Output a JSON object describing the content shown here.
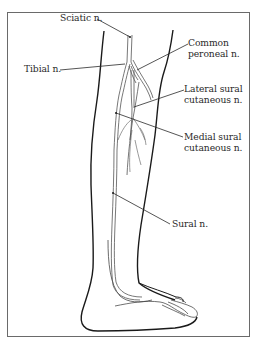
{
  "figure": {
    "labels": {
      "sciatic": "Sciatic n.",
      "tibial": "Tibial n.",
      "common_peroneal_1": "Common",
      "common_peroneal_2": "peroneal n.",
      "lateral_sural_1": "Lateral sural",
      "lateral_sural_2": "cutaneous n.",
      "medial_sural_1": "Medial sural",
      "medial_sural_2": "cutaneous n.",
      "sural": "Sural n."
    },
    "colors": {
      "outline": "#1a1a1a",
      "nerve": "#555555",
      "leader": "#2a2a2a",
      "frame": "#6a6a6a",
      "background": "#ffffff"
    }
  }
}
